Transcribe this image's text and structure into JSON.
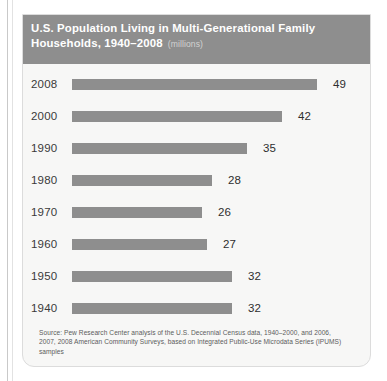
{
  "card": {
    "title_line1": "U.S. Population Living in Multi-Generational Family",
    "title_line2": "Households, 1940–2008",
    "units": "(millions)",
    "source": "Source: Pew Research Center analysis of the U.S. Decennial Census data, 1940–2000, and 2006, 2007, 2008 American Community Surveys, based on Integrated Public-Use Microdata Series (IPUMS) samples",
    "colors": {
      "header_background": "#8e8e8e",
      "bar": "#8e8e8e",
      "card_background": "#f7f7f6",
      "title_text": "#ffffff",
      "units_text": "#d2d2d2",
      "label_text": "#3a3a3a"
    }
  },
  "chart_data": {
    "type": "bar",
    "orientation": "horizontal",
    "title": "U.S. Population Living in Multi-Generational Family Households, 1940–2008",
    "subtitle": "(millions)",
    "xlabel": "",
    "ylabel": "",
    "unit": "millions",
    "grid": false,
    "legend": false,
    "xlim": [
      0,
      49
    ],
    "categories": [
      "2008",
      "2000",
      "1990",
      "1980",
      "1970",
      "1960",
      "1950",
      "1940"
    ],
    "values": [
      49,
      42,
      35,
      28,
      26,
      27,
      32,
      32
    ],
    "data_labels": [
      "49",
      "42",
      "35",
      "28",
      "26",
      "27",
      "32",
      "32"
    ],
    "source": "Pew Research Center analysis of the U.S. Decennial Census data, 1940–2000, and 2006, 2007, 2008 American Community Surveys, based on Integrated Public-Use Microdata Series (IPUMS) samples"
  }
}
